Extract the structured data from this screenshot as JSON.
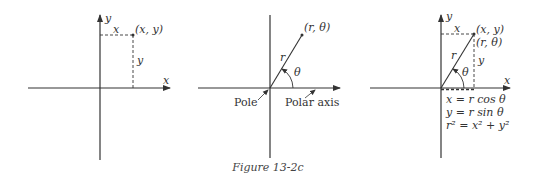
{
  "figure": {
    "caption": "Figure 13-2c"
  },
  "diagram_rect": {
    "x_axis_label": "x",
    "y_axis_label": "y",
    "point_label": "(x, y)",
    "horizontal_dash_label": "x",
    "vertical_dash_label": "y"
  },
  "diagram_polar": {
    "point_label": "(r, θ)",
    "radius_label": "r",
    "angle_label": "θ",
    "pole_label": "Pole",
    "polar_axis_label": "Polar axis"
  },
  "diagram_combined": {
    "x_axis_label": "x",
    "y_axis_label": "y",
    "point_rect_label": "(x, y)",
    "point_polar_label": "(r, θ)",
    "horizontal_dash_label": "x",
    "vertical_dash_label": "y",
    "radius_label": "r",
    "angle_label": "θ",
    "equations": [
      "x = r cos θ",
      "y = r sin θ",
      "r² = x² + y²"
    ]
  }
}
